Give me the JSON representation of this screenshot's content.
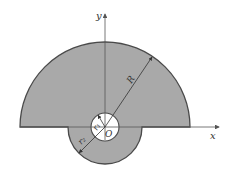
{
  "diagram": {
    "type": "cross-section",
    "colors": {
      "fill": "#a9a9a9",
      "outline": "#4a4a4a",
      "hole": "#ffffff",
      "axis": "#555555"
    },
    "labels": {
      "y_axis": "y",
      "x_axis": "x",
      "origin": "O",
      "big_radius": "R",
      "hole_radius": "r₁",
      "lobe_radius": "r₂"
    },
    "geometry": {
      "origin": [
        105,
        127
      ],
      "R": 85,
      "r1": 14,
      "r2": 37
    }
  }
}
